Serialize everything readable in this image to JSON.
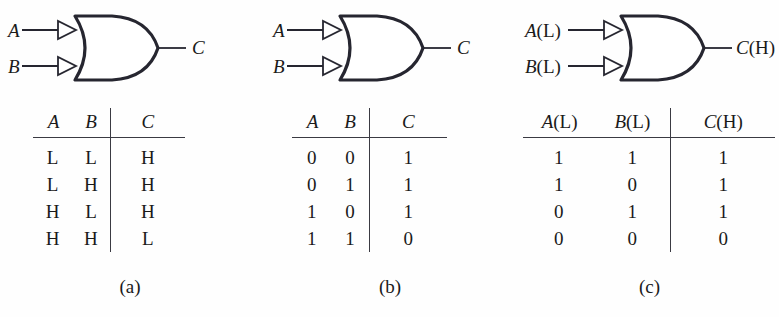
{
  "figure": {
    "stroke_color": "#262630",
    "text_color": "#1a1a1a",
    "background_color": "#fefefe"
  },
  "panels": [
    {
      "id": "a",
      "caption": "(a)",
      "gate": {
        "type": "or-gate",
        "input_indicator": "polarity-triangle",
        "inputs": [
          {
            "label": "A",
            "suffix": ""
          },
          {
            "label": "B",
            "suffix": ""
          }
        ],
        "output": {
          "label": "C",
          "suffix": ""
        }
      },
      "table": {
        "headers": [
          {
            "label": "A",
            "suffix": ""
          },
          {
            "label": "B",
            "suffix": ""
          },
          {
            "label": "C",
            "suffix": ""
          }
        ],
        "rows": [
          [
            "L",
            "L",
            "H"
          ],
          [
            "L",
            "H",
            "H"
          ],
          [
            "H",
            "L",
            "H"
          ],
          [
            "H",
            "H",
            "L"
          ]
        ]
      }
    },
    {
      "id": "b",
      "caption": "(b)",
      "gate": {
        "type": "or-gate",
        "input_indicator": "polarity-triangle",
        "inputs": [
          {
            "label": "A",
            "suffix": ""
          },
          {
            "label": "B",
            "suffix": ""
          }
        ],
        "output": {
          "label": "C",
          "suffix": ""
        }
      },
      "table": {
        "headers": [
          {
            "label": "A",
            "suffix": ""
          },
          {
            "label": "B",
            "suffix": ""
          },
          {
            "label": "C",
            "suffix": ""
          }
        ],
        "rows": [
          [
            "0",
            "0",
            "1"
          ],
          [
            "0",
            "1",
            "1"
          ],
          [
            "1",
            "0",
            "1"
          ],
          [
            "1",
            "1",
            "0"
          ]
        ]
      }
    },
    {
      "id": "c",
      "caption": "(c)",
      "gate": {
        "type": "or-gate",
        "input_indicator": "polarity-triangle",
        "inputs": [
          {
            "label": "A",
            "suffix": "(L)"
          },
          {
            "label": "B",
            "suffix": "(L)"
          }
        ],
        "output": {
          "label": "C",
          "suffix": "(H)"
        }
      },
      "table": {
        "headers": [
          {
            "label": "A",
            "suffix": "(L)"
          },
          {
            "label": "B",
            "suffix": "(L)"
          },
          {
            "label": "C",
            "suffix": "(H)"
          }
        ],
        "rows": [
          [
            "1",
            "1",
            "1"
          ],
          [
            "1",
            "0",
            "1"
          ],
          [
            "0",
            "1",
            "1"
          ],
          [
            "0",
            "0",
            "0"
          ]
        ]
      }
    }
  ]
}
